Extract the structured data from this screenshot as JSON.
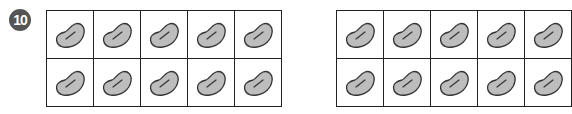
{
  "problem": {
    "number": "10",
    "badge_color": "#555555"
  },
  "ten_frames": [
    {
      "rows": 2,
      "cols": 5,
      "filled": 10,
      "counter": "bean"
    },
    {
      "rows": 2,
      "cols": 5,
      "filled": 10,
      "counter": "bean",
      "partially_visible": true
    }
  ],
  "colors": {
    "bean_fill": "#bdbdbd",
    "bean_stroke": "#333333",
    "grid_line": "#222222"
  }
}
